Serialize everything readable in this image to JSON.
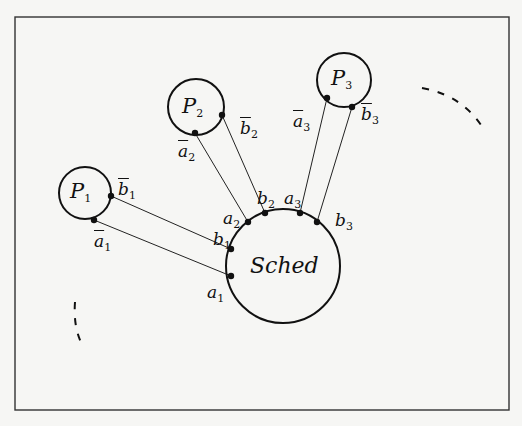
{
  "diagram": {
    "type": "process-scheduler connection diagram",
    "frame": {
      "x": 15,
      "y": 17,
      "width": 494,
      "height": 393
    },
    "nodes": [
      {
        "id": "P1",
        "label": "P",
        "sub": "1",
        "cx": 85,
        "cy": 193,
        "r": 26
      },
      {
        "id": "P2",
        "label": "P",
        "sub": "2",
        "cx": 196,
        "cy": 107,
        "r": 28
      },
      {
        "id": "P3",
        "label": "P",
        "sub": "3",
        "cx": 344,
        "cy": 80,
        "r": 27
      },
      {
        "id": "Sched",
        "label": "Sched",
        "cx": 283,
        "cy": 266,
        "r": 57
      }
    ],
    "ports": {
      "b1bar": {
        "name": "b",
        "sub": "1",
        "bar": true,
        "x": 111,
        "y": 196
      },
      "a1bar": {
        "name": "a",
        "sub": "1",
        "bar": true,
        "x": 94,
        "y": 220
      },
      "b2bar": {
        "name": "b",
        "sub": "2",
        "bar": true,
        "x": 222,
        "y": 115
      },
      "a2bar": {
        "name": "a",
        "sub": "2",
        "bar": true,
        "x": 195,
        "y": 133
      },
      "a3bar": {
        "name": "a",
        "sub": "3",
        "bar": true,
        "x": 327,
        "y": 98
      },
      "b3bar": {
        "name": "b",
        "sub": "3",
        "bar": true,
        "x": 352,
        "y": 107
      },
      "a1": {
        "name": "a",
        "sub": "1",
        "bar": false,
        "x": 231,
        "y": 276
      },
      "b1": {
        "name": "b",
        "sub": "1",
        "bar": false,
        "x": 231,
        "y": 249
      },
      "a2": {
        "name": "a",
        "sub": "2",
        "bar": false,
        "x": 248,
        "y": 222
      },
      "b2": {
        "name": "b",
        "sub": "2",
        "bar": false,
        "x": 265,
        "y": 213
      },
      "a3": {
        "name": "a",
        "sub": "3",
        "bar": false,
        "x": 300,
        "y": 213
      },
      "b3": {
        "name": "b",
        "sub": "3",
        "bar": false,
        "x": 317,
        "y": 222
      }
    },
    "edges": [
      [
        "b1bar",
        "b1"
      ],
      [
        "a1bar",
        "a1"
      ],
      [
        "a2bar",
        "a2"
      ],
      [
        "b2bar",
        "b2"
      ],
      [
        "a3bar",
        "a3"
      ],
      [
        "b3bar",
        "b3"
      ]
    ],
    "ellipsis_arcs": [
      {
        "position": "upper-right",
        "meaning": "more processes"
      },
      {
        "position": "lower-left",
        "meaning": "more processes"
      }
    ]
  },
  "labels": {
    "P": "P",
    "sched": "Sched",
    "a": "a",
    "b": "b",
    "s1": "1",
    "s2": "2",
    "s3": "3"
  }
}
